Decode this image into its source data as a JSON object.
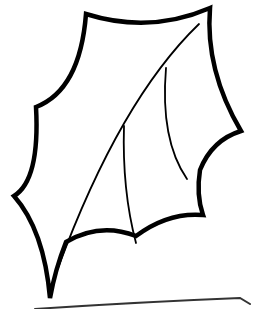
{
  "image": {
    "subject": "holly leaf outline drawing",
    "stroke_color": "#000000",
    "background_color": "#ffffff"
  }
}
